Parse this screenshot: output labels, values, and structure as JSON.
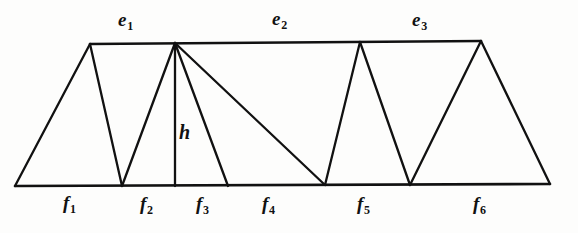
{
  "figure": {
    "background_color": "#fdfdfc",
    "line_color": "#111111",
    "width": 578,
    "height": 233
  },
  "top_labels": [
    {
      "name": "e1",
      "base": "e",
      "sub": "1",
      "x": 118,
      "y": 10
    },
    {
      "name": "e2",
      "base": "e",
      "sub": "2",
      "x": 272,
      "y": 9
    },
    {
      "name": "e3",
      "base": "e",
      "sub": "3",
      "x": 412,
      "y": 10
    }
  ],
  "bottom_labels": [
    {
      "name": "f1",
      "base": "f",
      "sub": "1",
      "x": 63,
      "y": 193
    },
    {
      "name": "f2",
      "base": "f",
      "sub": "2",
      "x": 140,
      "y": 194
    },
    {
      "name": "f3",
      "base": "f",
      "sub": "3",
      "x": 196,
      "y": 194
    },
    {
      "name": "f4",
      "base": "f",
      "sub": "4",
      "x": 262,
      "y": 194
    },
    {
      "name": "f5",
      "base": "f",
      "sub": "5",
      "x": 357,
      "y": 194
    },
    {
      "name": "f6",
      "base": "f",
      "sub": "6",
      "x": 473,
      "y": 194
    }
  ],
  "height_label": {
    "name": "h",
    "base": "h",
    "sub": "",
    "x": 179,
    "y": 122
  },
  "geometry": {
    "baseline": {
      "x1": 15,
      "y1": 186,
      "x2": 550,
      "y2": 184
    },
    "topline": {
      "x1": 90,
      "y1": 44,
      "x2": 481,
      "y2": 41
    },
    "vertices_bottom": [
      {
        "name": "b0",
        "x": 15,
        "y": 186
      },
      {
        "name": "b1",
        "x": 122,
        "y": 186
      },
      {
        "name": "b2",
        "x": 175,
        "y": 186
      },
      {
        "name": "b3",
        "x": 228,
        "y": 186
      },
      {
        "name": "b4",
        "x": 325,
        "y": 185
      },
      {
        "name": "b5",
        "x": 410,
        "y": 185
      },
      {
        "name": "b6",
        "x": 550,
        "y": 184
      }
    ],
    "vertices_top": [
      {
        "name": "t0",
        "x": 90,
        "y": 44
      },
      {
        "name": "t1",
        "x": 175,
        "y": 43
      },
      {
        "name": "t2",
        "x": 360,
        "y": 42
      },
      {
        "name": "t3",
        "x": 481,
        "y": 41
      }
    ],
    "segments": [
      {
        "name": "seg-b0-t0",
        "x1": 15,
        "y1": 186,
        "x2": 90,
        "y2": 44
      },
      {
        "name": "seg-t0-b1",
        "x1": 90,
        "y1": 44,
        "x2": 122,
        "y2": 186
      },
      {
        "name": "seg-b1-t1",
        "x1": 122,
        "y1": 186,
        "x2": 175,
        "y2": 43
      },
      {
        "name": "seg-t1-b2-height",
        "x1": 175,
        "y1": 43,
        "x2": 175,
        "y2": 186
      },
      {
        "name": "seg-t1-b3",
        "x1": 175,
        "y1": 43,
        "x2": 228,
        "y2": 186
      },
      {
        "name": "seg-t1-b4",
        "x1": 175,
        "y1": 43,
        "x2": 325,
        "y2": 185
      },
      {
        "name": "seg-b4-t2",
        "x1": 325,
        "y1": 185,
        "x2": 360,
        "y2": 42
      },
      {
        "name": "seg-t2-b5",
        "x1": 360,
        "y1": 42,
        "x2": 410,
        "y2": 185
      },
      {
        "name": "seg-b5-t3",
        "x1": 410,
        "y1": 185,
        "x2": 481,
        "y2": 41
      },
      {
        "name": "seg-t3-b6",
        "x1": 481,
        "y1": 41,
        "x2": 550,
        "y2": 184
      }
    ]
  }
}
